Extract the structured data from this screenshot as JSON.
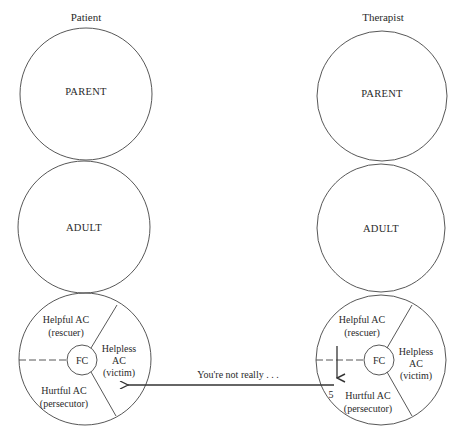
{
  "columns": [
    {
      "id": "patient",
      "title": "Patient",
      "ego_states": {
        "parent": "PARENT",
        "adult": "ADULT",
        "child": {
          "center": "FC",
          "segments": {
            "helpful": [
              "Helpful AC",
              "(rescuer)"
            ],
            "helpless": [
              "Helpless",
              "AC",
              "(victim)"
            ],
            "hurtful": [
              "Hurtful AC",
              "(persecutor)"
            ]
          }
        }
      }
    },
    {
      "id": "therapist",
      "title": "Therapist",
      "ego_states": {
        "parent": "PARENT",
        "adult": "ADULT",
        "child": {
          "center": "FC",
          "segments": {
            "helpful": [
              "Helpful AC",
              "(rescuer)"
            ],
            "helpless": [
              "Helpless",
              "AC",
              "(victim)"
            ],
            "hurtful": [
              "Hurtful AC",
              "(persecutor)"
            ]
          }
        }
      }
    }
  ],
  "transaction": {
    "message": "You're not really . . .",
    "number": "5",
    "from": "therapist hurtful AC",
    "to": "patient helpless AC"
  },
  "colors": {
    "stroke": "#3a3a3a",
    "text": "#2a2a2a",
    "background": "#ffffff"
  }
}
